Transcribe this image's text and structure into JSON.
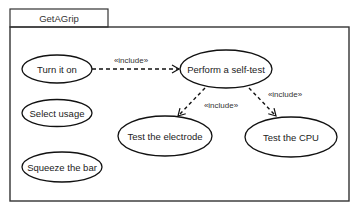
{
  "diagram": {
    "type": "uml-use-case",
    "system": {
      "name": "GetAGrip"
    },
    "use_cases": [
      {
        "id": "turn_on",
        "label": "Turn it on",
        "cx": 57,
        "cy": 69,
        "rx": 35,
        "ry": 14
      },
      {
        "id": "select_usage",
        "label": "Select usage",
        "cx": 57,
        "cy": 113,
        "rx": 35,
        "ry": 13.5
      },
      {
        "id": "squeeze_bar",
        "label": "Squeeze the bar",
        "cx": 62,
        "cy": 167,
        "rx": 40,
        "ry": 15
      },
      {
        "id": "self_test",
        "label": "Perform a self-test",
        "cx": 226,
        "cy": 69,
        "rx": 46,
        "ry": 19
      },
      {
        "id": "test_electrode",
        "label": "Test the electrode",
        "cx": 165,
        "cy": 136,
        "rx": 47,
        "ry": 20
      },
      {
        "id": "test_cpu",
        "label": "Test the CPU",
        "cx": 291,
        "cy": 137,
        "rx": 46,
        "ry": 20
      }
    ],
    "relationships": [
      {
        "from": "turn_on",
        "to": "self_test",
        "stereotype": "«include»"
      },
      {
        "from": "self_test",
        "to": "test_electrode",
        "stereotype": "«include»"
      },
      {
        "from": "self_test",
        "to": "test_cpu",
        "stereotype": "«include»"
      }
    ],
    "colors": {
      "stroke": "#111111",
      "frame": "#333333",
      "background": "#ffffff"
    }
  }
}
